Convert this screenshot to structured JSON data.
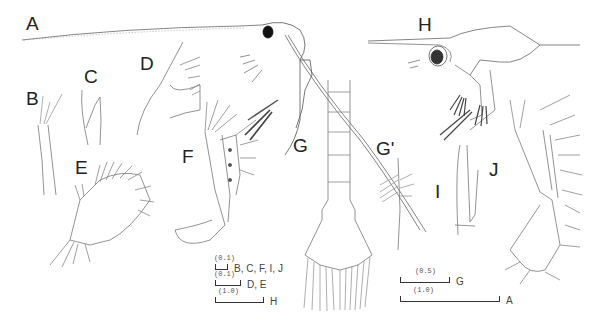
{
  "figure": {
    "panels": [
      {
        "id": "A",
        "label": "A",
        "description": "whole larva, lateral view"
      },
      {
        "id": "B",
        "label": "B",
        "description": "appendage"
      },
      {
        "id": "C",
        "label": "C",
        "description": "appendage"
      },
      {
        "id": "D",
        "label": "D",
        "description": "appendage"
      },
      {
        "id": "E",
        "label": "E",
        "description": "appendage"
      },
      {
        "id": "F",
        "label": "F",
        "description": "appendage"
      },
      {
        "id": "G",
        "label": "G",
        "description": "abdomen and telson, dorsal view"
      },
      {
        "id": "G'",
        "label": "G'",
        "description": "telson seta detail"
      },
      {
        "id": "H",
        "label": "H",
        "description": "whole larva, lateral view"
      },
      {
        "id": "I",
        "label": "I",
        "description": "appendage"
      },
      {
        "id": "J",
        "label": "J",
        "description": "appendage"
      }
    ],
    "scale_bars": [
      {
        "value": "(0.1)",
        "applies_to": "B, C, F, I, J"
      },
      {
        "value": "(0.1)",
        "applies_to": "D, E"
      },
      {
        "value": "(1.0)",
        "applies_to": "H"
      },
      {
        "value": "(0.5)",
        "applies_to": "G"
      },
      {
        "value": "(1.0)",
        "applies_to": "A"
      }
    ]
  }
}
